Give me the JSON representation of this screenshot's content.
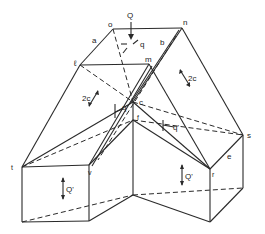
{
  "diagram": {
    "type": "isometric line drawing of folded-plate / roof block with load and shear labels",
    "vertex_labels": {
      "o": "o",
      "n": "n",
      "l": "ℓ",
      "m": "m",
      "c": "c",
      "f": "f",
      "s": "s",
      "r": "r",
      "e": "e",
      "t": "t",
      "v": "v"
    },
    "edge_labels": {
      "a": "a",
      "b": "b"
    },
    "force_labels": {
      "Q": "Q",
      "q": "q",
      "q_prime_left": "q'",
      "q_prime_right": "q'",
      "two_c_left": "2c",
      "two_c_right": "2c",
      "Q_prime_left": "Q'",
      "Q_prime_right": "Q'"
    },
    "colors": {
      "line": "#2a2a2a",
      "background": "#ffffff"
    }
  }
}
